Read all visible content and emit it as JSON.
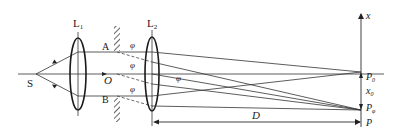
{
  "diagram": {
    "colors": {
      "stroke": "#2a2a2a",
      "background": "#ffffff"
    },
    "labels": {
      "source": "S",
      "lens1": "L",
      "lens1_sub": "1",
      "lens2": "L",
      "lens2_sub": "2",
      "slit_top": "A",
      "slit_bottom": "B",
      "center": "O",
      "angle_top": "φ",
      "angle_mid": "φ",
      "angle_bottom": "φ",
      "angle_right": "φ",
      "axis_x": "x",
      "point_p0": "P",
      "point_p0_sub": "0",
      "offset": "x",
      "offset_sub": "0",
      "point_pphi": "P",
      "point_pphi_sub": "φ",
      "point_p": "P",
      "distance": "D"
    }
  }
}
